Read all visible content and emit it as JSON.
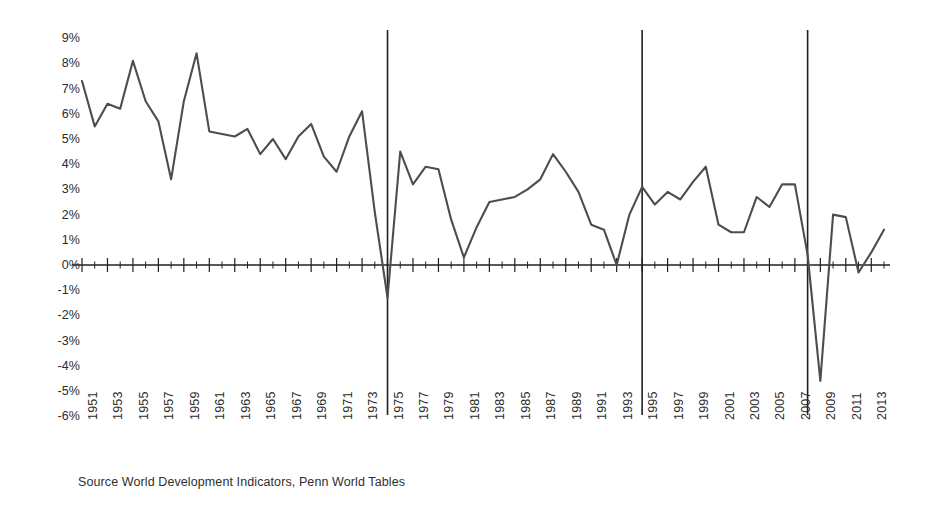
{
  "chart_data": {
    "type": "line",
    "title": "",
    "subtitle": "",
    "xlabel": "",
    "ylabel": "",
    "grid": false,
    "legend": null,
    "ylim": [
      -6,
      9
    ],
    "xlim": [
      1951,
      2014
    ],
    "y_tick_labels": [
      "9%",
      "8%",
      "7%",
      "6%",
      "5%",
      "4%",
      "3%",
      "2%",
      "1%",
      "0%",
      "-1%",
      "-2%",
      "-3%",
      "-4%",
      "-5%",
      "-6%"
    ],
    "y_tick_values": [
      9,
      8,
      7,
      6,
      5,
      4,
      3,
      2,
      1,
      0,
      -1,
      -2,
      -3,
      -4,
      -5,
      -6
    ],
    "x_tick_labels": [
      "1951",
      "1953",
      "1955",
      "1957",
      "1959",
      "1961",
      "1963",
      "1965",
      "1967",
      "1969",
      "1971",
      "1973",
      "1975",
      "1977",
      "1979",
      "1981",
      "1983",
      "1985",
      "1987",
      "1989",
      "1991",
      "1993",
      "1995",
      "1997",
      "1999",
      "2001",
      "2003",
      "2005",
      "2007",
      "2009",
      "2011",
      "2013"
    ],
    "x": [
      1951,
      1952,
      1953,
      1954,
      1955,
      1956,
      1957,
      1958,
      1959,
      1960,
      1961,
      1962,
      1963,
      1964,
      1965,
      1966,
      1967,
      1968,
      1969,
      1970,
      1971,
      1972,
      1973,
      1974,
      1975,
      1976,
      1977,
      1978,
      1979,
      1980,
      1981,
      1982,
      1983,
      1984,
      1985,
      1986,
      1987,
      1988,
      1989,
      1990,
      1991,
      1992,
      1993,
      1994,
      1995,
      1996,
      1997,
      1998,
      1999,
      2000,
      2001,
      2002,
      2003,
      2004,
      2005,
      2006,
      2007,
      2008,
      2009,
      2010,
      2011,
      2012,
      2013,
      2014
    ],
    "series": [
      {
        "name": "World GDP growth",
        "color": "#4d4d4d",
        "values": [
          7.3,
          5.5,
          6.4,
          6.2,
          8.1,
          6.5,
          5.7,
          3.4,
          6.5,
          8.4,
          5.3,
          5.2,
          5.1,
          5.4,
          4.4,
          5.0,
          4.2,
          5.1,
          5.6,
          4.3,
          3.7,
          5.1,
          6.1,
          2.1,
          -1.3,
          4.5,
          3.2,
          3.9,
          3.8,
          1.8,
          0.3,
          1.5,
          2.5,
          2.6,
          2.7,
          3.0,
          3.4,
          4.4,
          3.7,
          2.9,
          1.6,
          1.4,
          0.0,
          2.0,
          3.1,
          2.4,
          2.9,
          2.6,
          3.3,
          3.9,
          1.6,
          1.3,
          1.3,
          2.7,
          2.3,
          3.2,
          3.2,
          0.4,
          -4.6,
          2.0,
          1.9,
          -0.3,
          0.5,
          1.4
        ]
      }
    ],
    "annotations": [
      {
        "name": "marker-1975",
        "x": 1975,
        "label": ""
      },
      {
        "name": "marker-1995",
        "x": 1995,
        "label": ""
      },
      {
        "name": "marker-2008",
        "x": 2008,
        "label": ""
      }
    ],
    "vertical_markers": [
      1975,
      1995,
      2008
    ],
    "source_note": "Source World Development Indicators, Penn World Tables",
    "axis_color": "#231f20",
    "line_color": "#4d4d4d",
    "background": "#ffffff"
  }
}
